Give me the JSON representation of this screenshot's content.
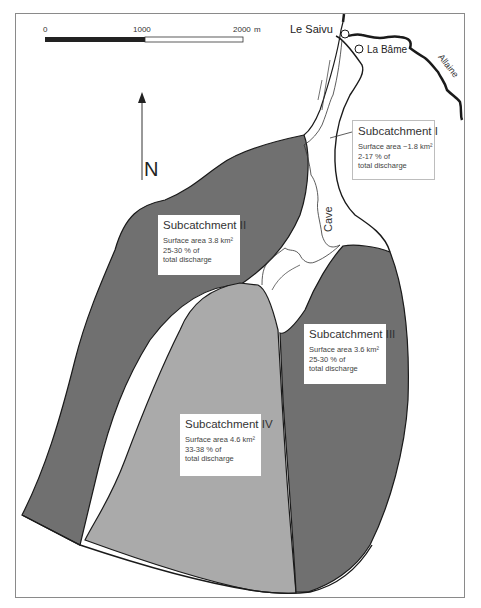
{
  "scale_bar": {
    "ticks": [
      "0",
      "1000",
      "2000"
    ],
    "unit": "m"
  },
  "north_arrow": {
    "label": "N"
  },
  "places": {
    "le_saivu": "Le Saivu",
    "la_bame": "La Bâme",
    "allaine": "Allaine",
    "cave": "Cave"
  },
  "colors": {
    "dark_subcatchment": "#6f6f6f",
    "light_subcatchment": "#a9a9a9",
    "outline": "#1a1a1a",
    "background": "#ffffff"
  },
  "subcatchments": [
    {
      "title": "Subcatchment I",
      "area": "Surface area ~1.8 km²",
      "pct": "2-17 % of",
      "note": "total discharge"
    },
    {
      "title": "Subcatchment II",
      "area": "Surface area 3.8 km²",
      "pct": "25-30 % of",
      "note": "total discharge"
    },
    {
      "title": "Subcatchment III",
      "area": "Surface area 3.6 km²",
      "pct": "25-30 % of",
      "note": "total discharge"
    },
    {
      "title": "Subcatchment IV",
      "area": "Surface area 4.6 km²",
      "pct": "33-38 % of",
      "note": "total discharge"
    }
  ]
}
